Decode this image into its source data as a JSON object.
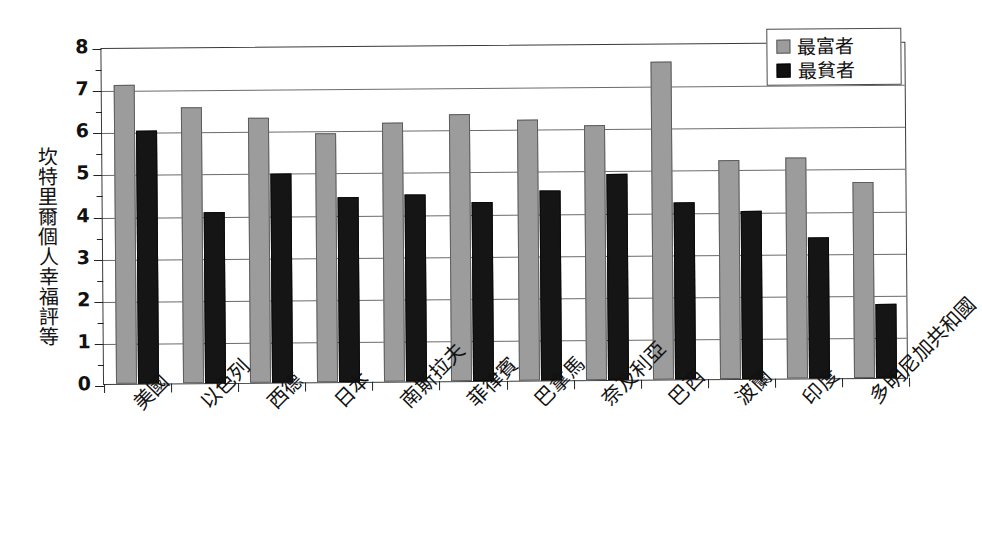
{
  "chart_data": {
    "type": "bar",
    "title": "",
    "xlabel": "",
    "ylabel": "坎特里爾個人幸福評等",
    "ylim": [
      0,
      8
    ],
    "ytick_labels": [
      "0",
      "1",
      "2",
      "3",
      "4",
      "5",
      "6",
      "7",
      "8"
    ],
    "grid": true,
    "legend_position": "top-right",
    "categories": [
      "美國",
      "以色列",
      "西德",
      "日本",
      "南斯拉夫",
      "菲律賓",
      "巴拿馬",
      "奈及利亞",
      "巴西",
      "波蘭",
      "印度",
      "多明尼加共和國"
    ],
    "series": [
      {
        "name": "最富者",
        "color": "#9c9c9c",
        "values": [
          7.1,
          6.55,
          6.3,
          5.9,
          6.15,
          6.35,
          6.2,
          6.05,
          7.55,
          5.2,
          5.25,
          4.65
        ]
      },
      {
        "name": "最貧者",
        "color": "#151515",
        "values": [
          6.0,
          4.05,
          4.95,
          4.4,
          4.45,
          4.25,
          4.5,
          4.9,
          4.2,
          4.0,
          3.35,
          1.75
        ]
      }
    ]
  },
  "legend": {
    "entries": [
      {
        "label": "最富者",
        "swatch": "gray-swatch"
      },
      {
        "label": "最貧者",
        "swatch": "black-swatch"
      }
    ]
  },
  "caption": "－－－－－－－－－－"
}
